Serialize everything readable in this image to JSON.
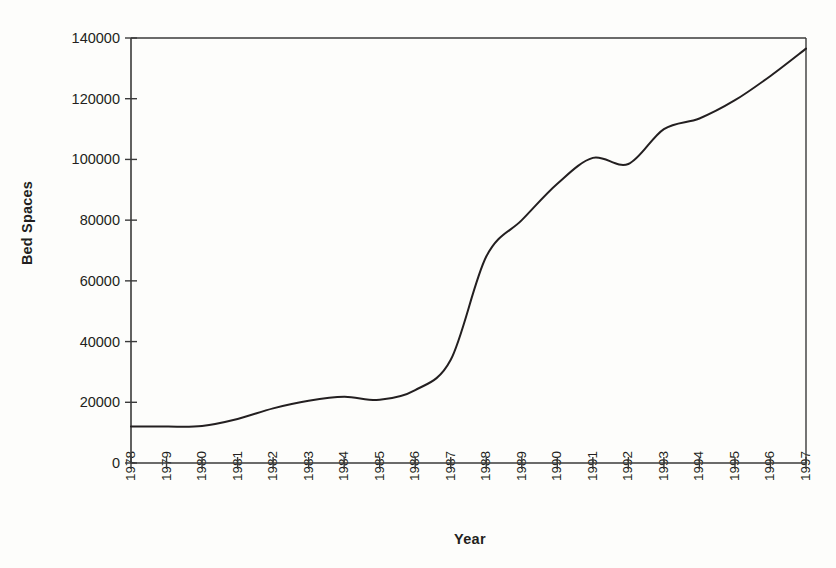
{
  "chart_data": {
    "type": "line",
    "title": "",
    "xlabel": "Year",
    "ylabel": "Bed Spaces",
    "categories": [
      "1978",
      "1979",
      "1980",
      "1981",
      "1982",
      "1983",
      "1984",
      "1985",
      "1986",
      "1987",
      "1988",
      "1989",
      "1990",
      "1991",
      "1992",
      "1993",
      "1994",
      "1995",
      "1996",
      "1997"
    ],
    "x": [
      1978,
      1979,
      1980,
      1981,
      1982,
      1983,
      1984,
      1985,
      1986,
      1987,
      1988,
      1989,
      1990,
      1991,
      1992,
      1993,
      1994,
      1995,
      1996,
      1997
    ],
    "values": [
      12000,
      12000,
      12200,
      14500,
      18000,
      20500,
      21800,
      20800,
      24000,
      34000,
      68000,
      80000,
      92000,
      100500,
      98500,
      110000,
      113500,
      119500,
      127500,
      136500
    ],
    "series": [
      {
        "name": "Bed Spaces",
        "values": [
          12000,
          12000,
          12200,
          14500,
          18000,
          20500,
          21800,
          20800,
          24000,
          34000,
          68000,
          80000,
          92000,
          100500,
          98500,
          110000,
          113500,
          119500,
          127500,
          136500
        ]
      }
    ],
    "ylim": [
      0,
      140000
    ],
    "xlim": [
      1978,
      1997
    ],
    "yticks": [
      0,
      20000,
      40000,
      60000,
      80000,
      100000,
      120000,
      140000
    ],
    "ytick_labels": [
      "0",
      "20000",
      "40000",
      "60000",
      "80000",
      "100000",
      "120000",
      "140000"
    ],
    "xtick_labels": [
      "1978",
      "1979",
      "1980",
      "1981",
      "1982",
      "1983",
      "1984",
      "1985",
      "1986",
      "1987",
      "1988",
      "1989",
      "1990",
      "1991",
      "1992",
      "1993",
      "1994",
      "1995",
      "1996",
      "1997"
    ],
    "grid": false,
    "legend": "none",
    "line_color": "#231f20",
    "line_width": 2,
    "axis_color": "#3a3a3a",
    "background_color": "#fdfdfb",
    "smoothing": "spline"
  }
}
